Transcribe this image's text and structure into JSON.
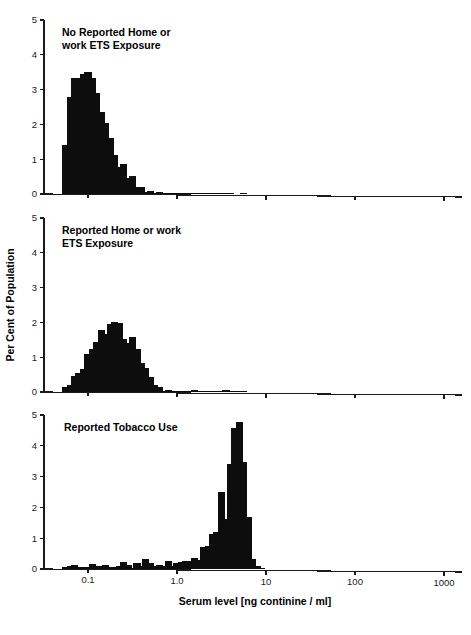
{
  "figure": {
    "width": 471,
    "height": 635,
    "background": "#ffffff",
    "bar_color": "#0d0d0d",
    "axis_color": "#1a1a1a"
  },
  "axes": {
    "y_label": "Per Cent of Population",
    "x_label": "Serum level [ng continine / ml]",
    "y_ticks": [
      "0",
      "1",
      "2",
      "3",
      "4",
      "5"
    ],
    "y_tick_values": [
      0,
      1,
      2,
      3,
      4,
      5
    ],
    "x_ticks": [
      "0.1",
      "1.0",
      "10",
      "100",
      "1000"
    ],
    "x_tick_values": [
      0.1,
      1.0,
      10,
      100,
      1000
    ]
  },
  "chart_data": [
    {
      "type": "bar",
      "panel": 1,
      "title": "No Reported Home or\nwork ETS Exposure",
      "title_lines": [
        "No Reported Home or",
        "work ETS Exposure"
      ],
      "xlabel": "",
      "ylabel": "Per Cent of Population",
      "xscale": "log",
      "xlim": [
        0.04,
        2000
      ],
      "ylim": [
        0,
        5
      ],
      "grid": false,
      "legend": "none",
      "x": [
        0.056,
        0.063,
        0.071,
        0.079,
        0.089,
        0.1,
        0.112,
        0.126,
        0.141,
        0.158,
        0.178,
        0.2,
        0.224,
        0.251,
        0.282,
        0.316,
        0.355,
        0.398,
        0.447,
        0.501,
        0.562,
        0.631,
        0.708,
        0.794,
        0.891,
        1.0,
        1.122,
        1.259,
        1.413,
        1.585,
        1.778,
        2.0,
        2.239,
        2.512,
        2.818,
        3.162,
        3.548,
        3.981,
        4.467,
        5.012,
        5.623,
        6.31,
        7.079,
        7.943,
        8.913,
        10.0,
        11.22,
        12.59,
        14.13,
        15.85,
        17.78,
        20.0,
        22.39,
        25.12,
        28.18,
        31.62,
        35.48,
        39.81,
        44.67,
        50.12,
        56.23,
        63.1,
        70.79,
        79.43,
        89.13,
        100.0,
        112.2,
        125.9,
        141.3,
        158.5,
        177.8,
        200.0,
        223.9,
        251.2,
        281.8,
        316.2,
        354.8,
        398.1,
        446.7,
        501.2,
        562.3,
        631.0,
        707.9,
        794.3,
        891.3,
        1000.0
      ],
      "values": [
        1.4,
        2.8,
        3.34,
        3.34,
        3.46,
        3.52,
        3.34,
        2.9,
        2.35,
        2.05,
        1.6,
        1.12,
        0.77,
        0.87,
        0.47,
        0.53,
        0.2,
        0.2,
        0.05,
        0.1,
        0.03,
        0.06,
        0.02,
        0.03,
        0.02,
        0.03,
        0.04,
        0.04,
        0.03,
        0.03,
        0.02,
        0.04,
        0.02,
        0.02,
        0.03,
        0.03,
        0.02,
        0.02,
        0.0,
        0.0,
        0.02,
        0.0,
        0.0,
        0.0,
        0.0,
        0.0,
        0.0,
        0.0,
        0.0,
        0.0,
        0.0,
        0.0,
        0.0,
        0.0,
        0.0,
        0.0,
        0.0,
        0.0,
        0.0,
        0.0,
        0.0,
        0.0,
        0.0,
        0.0,
        0.0,
        0.0,
        0.0,
        0.0,
        0.0,
        0.0,
        0.0,
        0.0,
        0.0,
        0.0,
        0.0,
        0.0,
        0.0,
        0.0,
        0.0,
        0.0,
        0.0,
        0.0,
        0.0,
        0.0,
        0.0,
        0.0
      ]
    },
    {
      "type": "bar",
      "panel": 2,
      "title": "Reported Home or work\nETS Exposure",
      "title_lines": [
        "Reported Home or work",
        "ETS Exposure"
      ],
      "xlabel": "",
      "ylabel": "Per Cent of Population",
      "xscale": "log",
      "xlim": [
        0.04,
        2000
      ],
      "ylim": [
        0,
        5
      ],
      "grid": false,
      "legend": "none",
      "x": [
        0.056,
        0.063,
        0.071,
        0.079,
        0.089,
        0.1,
        0.112,
        0.126,
        0.141,
        0.158,
        0.178,
        0.2,
        0.224,
        0.251,
        0.282,
        0.316,
        0.355,
        0.398,
        0.447,
        0.501,
        0.562,
        0.631,
        0.708,
        0.794,
        0.891,
        1.0,
        1.122,
        1.259,
        1.413,
        1.585,
        1.778,
        2.0,
        2.239,
        2.512,
        2.818,
        3.162,
        3.548,
        3.981,
        4.467,
        5.012,
        5.623,
        6.31,
        7.079,
        7.943,
        8.913,
        10.0,
        11.22,
        12.59,
        14.13,
        15.85,
        17.78,
        20.0,
        22.39,
        25.12,
        28.18,
        31.62,
        35.48,
        39.81,
        44.67,
        50.12,
        56.23,
        63.1,
        70.79,
        79.43,
        89.13,
        100.0,
        112.2,
        125.9,
        141.3,
        158.5,
        177.8,
        200.0,
        223.9,
        251.2,
        281.8,
        316.2,
        354.8,
        398.1,
        446.7,
        501.2,
        562.3,
        631.0,
        707.9,
        794.3,
        891.3,
        1000.0
      ],
      "values": [
        0.14,
        0.21,
        0.47,
        0.56,
        0.67,
        1.08,
        1.24,
        1.44,
        1.78,
        1.68,
        1.94,
        2.02,
        1.97,
        1.52,
        1.41,
        1.58,
        1.25,
        0.84,
        0.69,
        0.43,
        0.19,
        0.13,
        0.03,
        0.05,
        0.03,
        0.03,
        0.03,
        0.03,
        0.04,
        0.05,
        0.02,
        0.02,
        0.03,
        0.03,
        0.04,
        0.03,
        0.05,
        0.03,
        0.02,
        0.02,
        0.02,
        0.0,
        0.0,
        0.0,
        0.0,
        0.0,
        0.0,
        0.0,
        0.0,
        0.0,
        0.0,
        0.0,
        0.0,
        0.0,
        0.0,
        0.0,
        0.0,
        0.0,
        0.0,
        0.0,
        0.0,
        0.0,
        0.0,
        0.0,
        0.0,
        0.0,
        0.0,
        0.0,
        0.0,
        0.0,
        0.0,
        0.0,
        0.0,
        0.0,
        0.0,
        0.0,
        0.0,
        0.0,
        0.0,
        0.0,
        0.0,
        0.0,
        0.0,
        0.0,
        0.0,
        0.0
      ]
    },
    {
      "type": "bar",
      "panel": 3,
      "title": "Reported Tobacco Use",
      "title_lines": [
        "Reported Tobacco Use"
      ],
      "xlabel": "Serum level [ng continine / ml]",
      "ylabel": "Per Cent of Population",
      "xscale": "log",
      "xlim": [
        0.04,
        2000
      ],
      "ylim": [
        0,
        5
      ],
      "grid": false,
      "legend": "none",
      "x": [
        0.056,
        0.063,
        0.071,
        0.079,
        0.089,
        0.1,
        0.112,
        0.126,
        0.141,
        0.158,
        0.178,
        0.2,
        0.224,
        0.251,
        0.282,
        0.316,
        0.355,
        0.398,
        0.447,
        0.501,
        0.562,
        0.631,
        0.708,
        0.794,
        0.891,
        1.0,
        1.122,
        1.259,
        1.413,
        1.585,
        1.778,
        2.0,
        2.239,
        2.512,
        2.818,
        3.162,
        3.548,
        3.981,
        4.467,
        5.012,
        5.623,
        6.31,
        7.079,
        7.943,
        8.913,
        10.0,
        11.22,
        12.59,
        14.13,
        15.85,
        17.78,
        20.0,
        22.39,
        25.12,
        28.18,
        31.62,
        35.48,
        39.81,
        44.67,
        50.12,
        56.23,
        63.1,
        70.79,
        79.43,
        89.13,
        100.0,
        112.2,
        125.9,
        141.3,
        158.5,
        177.8,
        200.0,
        223.9,
        251.2,
        281.8,
        316.2,
        354.8,
        398.1,
        446.7,
        501.2,
        562.3,
        631.0,
        707.9,
        794.3,
        891.3,
        1000.0
      ],
      "values": [
        0.06,
        0.09,
        0.12,
        0.05,
        0.05,
        0.07,
        0.15,
        0.1,
        0.09,
        0.12,
        0.08,
        0.06,
        0.11,
        0.22,
        0.12,
        0.02,
        0.18,
        0.11,
        0.32,
        0.21,
        0.11,
        0.12,
        0.11,
        0.25,
        0.09,
        0.21,
        0.23,
        0.25,
        0.27,
        0.37,
        0.29,
        0.7,
        0.74,
        1.15,
        1.19,
        2.51,
        1.62,
        3.42,
        4.57,
        4.77,
        3.48,
        1.68,
        0.31,
        0.11,
        0.02,
        0.0,
        0.0,
        0.0,
        0.0,
        0.0,
        0.0,
        0.0,
        0.0,
        0.0,
        0.0,
        0.0,
        0.0,
        0.0,
        0.0,
        0.0,
        0.0,
        0.0,
        0.0,
        0.0,
        0.0,
        0.0,
        0.0,
        0.0,
        0.0,
        0.0,
        0.0,
        0.0,
        0.0,
        0.0,
        0.0,
        0.0,
        0.0,
        0.0,
        0.0,
        0.0,
        0.0,
        0.0,
        0.0,
        0.0,
        0.0,
        0.0
      ]
    }
  ]
}
